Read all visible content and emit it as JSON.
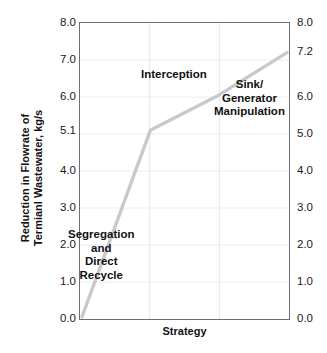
{
  "chart_data": {
    "type": "line",
    "title": "",
    "xlabel": "Strategy",
    "ylabel": "Reduction in Flowrate of Termianl Wastewater, kg/s",
    "ylabel_lines": [
      "Reduction in Flowrate of",
      "Termianl Wastewater, kg/s"
    ],
    "x": [
      0,
      1,
      2,
      3
    ],
    "values": [
      0.0,
      5.1,
      6.05,
      7.2
    ],
    "ylim": [
      0.0,
      8.0
    ],
    "xlim": [
      0,
      3
    ],
    "grid": true,
    "legend": "none",
    "line_color": "#c9c9c9",
    "frame_color": "#6e6e6e",
    "left_axis": {
      "ticks": [
        "8.0",
        "7.0",
        "6.0",
        "5.1",
        "4.0",
        "3.0",
        "2.0",
        "1.0",
        "0.0"
      ],
      "tick_values": [
        8.0,
        7.0,
        6.0,
        5.1,
        4.0,
        3.0,
        2.0,
        1.0,
        0.0
      ]
    },
    "right_axis": {
      "ticks": [
        "8.0",
        "7.2",
        "6.0",
        "5.0",
        "4.0",
        "3.0",
        "2.0",
        "1.0",
        "0.0"
      ],
      "tick_values": [
        8.0,
        7.2,
        6.0,
        5.0,
        4.0,
        3.0,
        2.0,
        1.0,
        0.0
      ]
    },
    "annotations": [
      {
        "name": "interception",
        "lines": [
          "Interception"
        ],
        "at_value": 6.05
      },
      {
        "name": "sink-generator-manipulation",
        "lines": [
          "Sink/",
          "Generator",
          "Manipulation"
        ],
        "at_value": 7.2
      },
      {
        "name": "segregation-and-direct-recycle",
        "lines": [
          "Segregation",
          "and",
          "Direct",
          "Recycle"
        ],
        "at_value": 0.0
      }
    ]
  },
  "axes": {
    "left": {
      "t0": "8.0",
      "t1": "7.0",
      "t2": "6.0",
      "t3": "5.1",
      "t4": "4.0",
      "t5": "3.0",
      "t6": "2.0",
      "t7": "1.0",
      "t8": "0.0"
    },
    "right": {
      "t0": "8.0",
      "t1": "7.2",
      "t2": "6.0",
      "t3": "5.0",
      "t4": "4.0",
      "t5": "3.0",
      "t6": "2.0",
      "t7": "1.0",
      "t8": "0.0"
    }
  },
  "labels": {
    "x_axis": "Strategy",
    "y_axis_line1": "Reduction in Flowrate of",
    "y_axis_line2": "Termianl Wastewater, kg/s",
    "interception": "Interception",
    "sink_line1": "Sink/",
    "sink_line2": "Generator",
    "sink_line3": "Manipulation",
    "seg_line1": "Segregation",
    "seg_line2": "and",
    "seg_line3": "Direct",
    "seg_line4": "Recycle",
    "caption": ""
  }
}
